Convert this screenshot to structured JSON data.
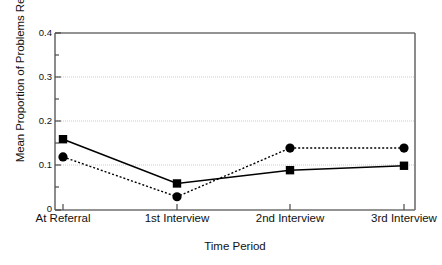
{
  "chart_data": {
    "type": "line",
    "title": "",
    "xlabel": "Time Period",
    "ylabel": "Mean Proportion of Problems Reported",
    "categories": [
      "At Referral",
      "1st Interview",
      "2nd Interview",
      "3rd Interview"
    ],
    "ylim": [
      0,
      0.4
    ],
    "yticks": [
      0,
      0.1,
      0.2,
      0.3,
      0.4
    ],
    "ytick_labels": [
      "0",
      "0.1",
      "0.2",
      "0.3",
      "0.4"
    ],
    "yminor_ticks": [
      0.05,
      0.15,
      0.25,
      0.35
    ],
    "grid": "horizontal-dotted-at-major-ticks",
    "legend": "none",
    "series": [
      {
        "name": "solid-square-series",
        "marker": "square",
        "line_style": "solid",
        "color": "#000000",
        "values": [
          0.16,
          0.06,
          0.09,
          0.1
        ]
      },
      {
        "name": "dotted-circle-series",
        "marker": "circle",
        "line_style": "dotted",
        "color": "#000000",
        "values": [
          0.12,
          0.03,
          0.14,
          0.14
        ]
      }
    ]
  },
  "axes": {
    "frame_color": "#6f6f6f",
    "grid_color": "#cccccc"
  }
}
